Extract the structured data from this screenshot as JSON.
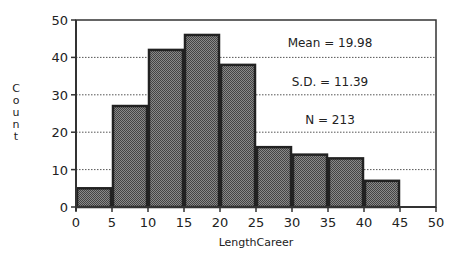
{
  "chart_data": {
    "type": "bar",
    "subtype": "histogram",
    "title": "",
    "xlabel": "LengthCareer",
    "ylabel": "Count",
    "bin_edges": [
      0,
      5,
      10,
      15,
      20,
      25,
      30,
      35,
      40,
      45
    ],
    "categories": [
      "0-5",
      "5-10",
      "10-15",
      "15-20",
      "20-25",
      "25-30",
      "30-35",
      "35-40",
      "40-45"
    ],
    "values": [
      5,
      27,
      42,
      46,
      38,
      16,
      14,
      13,
      7
    ],
    "xlim": [
      0,
      50
    ],
    "ylim": [
      0,
      50
    ],
    "x_ticks": [
      0,
      5,
      10,
      15,
      20,
      25,
      30,
      35,
      40,
      45,
      50
    ],
    "y_ticks": [
      0,
      10,
      20,
      30,
      40,
      50
    ],
    "grid": "horizontal dotted",
    "annotations": [
      {
        "label": "Mean",
        "text": "Mean = 19.98"
      },
      {
        "label": "S.D.",
        "text": "S.D. = 11.39"
      },
      {
        "label": "N",
        "text": "N = 213"
      }
    ]
  },
  "colors": {
    "bar_fill": "#6e6e6e",
    "bar_edge": "#222222",
    "axis": "#333333",
    "grid": "#555555"
  }
}
